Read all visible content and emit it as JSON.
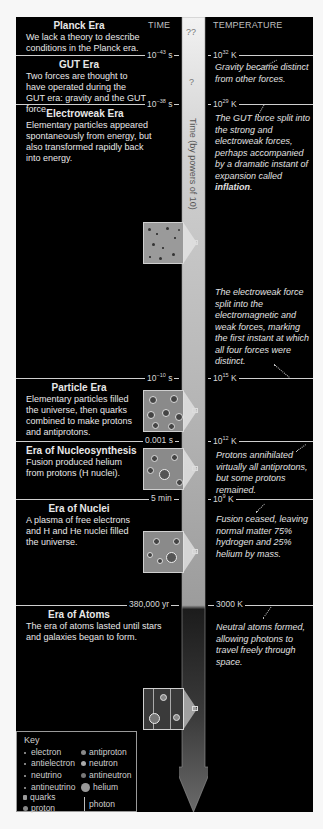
{
  "headers": {
    "time": "TIME",
    "temperature": "TEMPERATURE"
  },
  "axis_label": "Time (by powers of 10)",
  "unknowns": [
    "??",
    "?"
  ],
  "eras": [
    {
      "title": "Planck Era",
      "description": "We lack a theory to describe conditions in the Planck era."
    },
    {
      "title": "GUT Era",
      "description": "Two forces are thought to have operated during the GUT era: gravity and the GUT force."
    },
    {
      "title": "Electroweak Era",
      "description": "Elementary particles appeared spontaneously from energy, but also transformed rapidly back into energy."
    },
    {
      "title": "Particle Era",
      "description": "Elementary particles filled the universe, then quarks combined to make protons and antiprotons."
    },
    {
      "title": "Era of Nucleosynthesis",
      "description": "Fusion produced helium from protons (H nuclei)."
    },
    {
      "title": "Era of Nuclei",
      "description": "A plasma of free electrons and H and He nuclei filled the universe."
    },
    {
      "title": "Era of Atoms",
      "description": "The era of atoms lasted until stars and galaxies began to form."
    }
  ],
  "boundaries": [
    {
      "time_base": "10",
      "time_exp": "−43",
      "time_unit": " s",
      "temp_base": "10",
      "temp_exp": "32",
      "temp_unit": " K"
    },
    {
      "time_base": "10",
      "time_exp": "−38",
      "time_unit": " s",
      "temp_base": "10",
      "temp_exp": "29",
      "temp_unit": " K"
    },
    {
      "time_base": "10",
      "time_exp": "−10",
      "time_unit": " s",
      "temp_base": "10",
      "temp_exp": "15",
      "temp_unit": " K"
    },
    {
      "time_base": "0.001 s",
      "time_exp": "",
      "time_unit": "",
      "temp_base": "10",
      "temp_exp": "12",
      "temp_unit": " K"
    },
    {
      "time_base": "5 min",
      "time_exp": "",
      "time_unit": "",
      "temp_base": "10",
      "temp_exp": "9",
      "temp_unit": " K"
    },
    {
      "time_base": "380,000 yr",
      "time_exp": "",
      "time_unit": "",
      "temp_base": "3000 K",
      "temp_exp": "",
      "temp_unit": ""
    }
  ],
  "notes": [
    "Gravity became distinct from other forces.",
    "The GUT force split into the strong and electroweak forces, perhaps accompanied by a dramatic instant of expansion called",
    "inflation",
    "The electroweak force split into the electromagnetic and weak forces, marking the first instant at which all four forces were distinct.",
    "Protons annihilated virtually all antiprotons, but some protons remained.",
    "Fusion ceased, leaving normal matter 75% hydrogen and 25% helium by mass.",
    "Neutral atoms formed, allowing photons to travel freely through space."
  ],
  "key": {
    "title": "Key",
    "items": [
      "electron",
      "antielectron",
      "neutrino",
      "antineutrino",
      "quarks",
      "proton",
      "antiproton",
      "neutron",
      "antineutron",
      "helium",
      "photon"
    ]
  },
  "colors": {
    "background": "#000000",
    "text": "#e8e8e8",
    "arrow_light": "#d4d4d4",
    "arrow_dark": "#3a3a3a",
    "line": "#cfcfcf"
  }
}
